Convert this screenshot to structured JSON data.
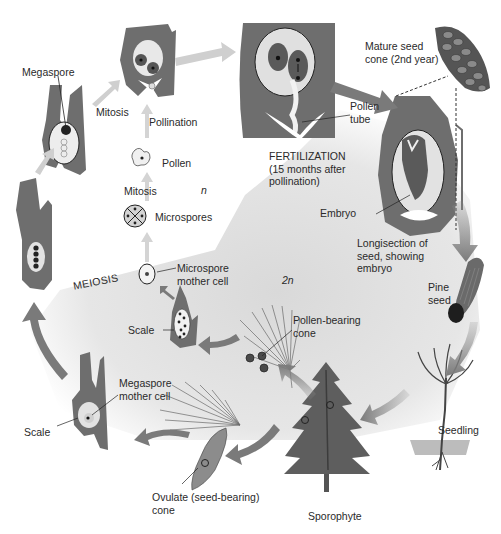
{
  "diagram": {
    "colors": {
      "tissue": "#6e6e6e",
      "tissue_dark": "#555555",
      "arrow": "#8a8a8a",
      "arrow_light": "#c8c8c8",
      "diploid_bg": "#e4e4e4",
      "haploid_bg": "#ffffff",
      "text": "#2a2a2a"
    },
    "phases": {
      "haploid": "n",
      "diploid": "2n"
    },
    "labels": {
      "megaspore": "Megaspore",
      "mitosis_1": "Mitosis",
      "pollination": "Pollination",
      "pollen": "Pollen",
      "mitosis_2": "Mitosis",
      "microspores": "Microspores",
      "meiosis": "MEIOSIS",
      "microspore_mother_cell": "Microspore\nmother cell",
      "scale_upper": "Scale",
      "pollen_bearing_cone": "Pollen-bearing\ncone",
      "megaspore_mother_cell": "Megaspore\nmother cell",
      "scale_lower": "Scale",
      "ovulate_cone": "Ovulate (seed-bearing)\ncone",
      "sporophyte": "Sporophyte",
      "seedling": "Seedling",
      "pine_seed": "Pine\nseed",
      "longisection": "Longisection of\nseed, showing\nembryo",
      "embryo": "Embryo",
      "fertilization": "FERTILIZATION\n(15 months after\npollination)",
      "pollen_tube": "Pollen\ntube",
      "mature_seed_cone": "Mature seed\ncone (2nd year)"
    }
  }
}
